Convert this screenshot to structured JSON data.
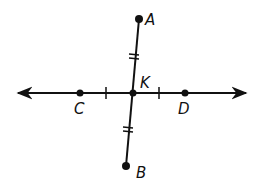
{
  "diagram": {
    "points": {
      "A": {
        "label": "A",
        "x": 139,
        "y": 19
      },
      "B": {
        "label": "B",
        "x": 126,
        "y": 166
      },
      "C": {
        "label": "C",
        "x": 80,
        "y": 93
      },
      "D": {
        "label": "D",
        "x": 185,
        "y": 93
      },
      "K": {
        "label": "K",
        "x": 133,
        "y": 93
      }
    },
    "line_CD": {
      "x1": 16,
      "x2": 248,
      "y": 93,
      "arrows": "both"
    },
    "segment_AB": {
      "from": "A",
      "to": "B"
    },
    "congruence_marks": {
      "single_tick": [
        "CK",
        "KD"
      ],
      "double_tick": [
        "AK",
        "KB"
      ]
    },
    "color": "#111111"
  }
}
